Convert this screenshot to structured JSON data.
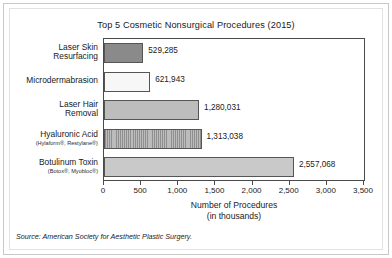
{
  "chart_data": {
    "type": "bar",
    "orientation": "horizontal",
    "title": "Top 5 Cosmetic Nonsurgical Procedures (2015)",
    "xlabel_line1": "Number of Procedures",
    "xlabel_line2": "(in thousands)",
    "ylabel": "",
    "xlim": [
      0,
      3500
    ],
    "xticks": [
      "0",
      "500",
      "1,000",
      "1,500",
      "2,000",
      "2,500",
      "3,000",
      "3,500"
    ],
    "xtick_values": [
      0,
      500,
      1000,
      1500,
      2000,
      2500,
      3000,
      3500
    ],
    "grid": false,
    "legend": "none",
    "units_note": "Bar lengths are in thousands of procedures; data labels show exact counts.",
    "categories": [
      "Laser Skin Resurfacing",
      "Microdermabrasion",
      "Laser Hair Removal",
      "Hyaluronic Acid",
      "Botulinum Toxin"
    ],
    "values": [
      529.285,
      621.943,
      1280.031,
      1313.038,
      2557.068
    ],
    "bars": [
      {
        "label_line1": "Laser Skin",
        "label_line2": "Resurfacing",
        "sublabel": "",
        "value": 529.285,
        "value_label": "529,285",
        "fill": "dark-gray",
        "color": "#8a8a8a"
      },
      {
        "label_line1": "Microdermabrasion",
        "label_line2": "",
        "sublabel": "",
        "value": 621.943,
        "value_label": "621,943",
        "fill": "white",
        "color": "#f7f7f7"
      },
      {
        "label_line1": "Laser Hair",
        "label_line2": "Removal",
        "sublabel": "",
        "value": 1280.031,
        "value_label": "1,280,031",
        "fill": "medium-gray",
        "color": "#bdbdbd"
      },
      {
        "label_line1": "Hyaluronic Acid",
        "label_line2": "",
        "sublabel": "(Hylaform®, Restylane®)",
        "value": 1313.038,
        "value_label": "1,313,038",
        "fill": "hatched-gray",
        "color": "#a8a8a8"
      },
      {
        "label_line1": "Botulinum Toxin",
        "label_line2": "",
        "sublabel": "(Botox®, Myobloc®)",
        "value": 2557.068,
        "value_label": "2,557,068",
        "fill": "light-gray",
        "color": "#c9c9c9"
      }
    ]
  },
  "source": {
    "label": "Source:",
    "text": " American Society for Aesthetic Plastic Surgery."
  }
}
